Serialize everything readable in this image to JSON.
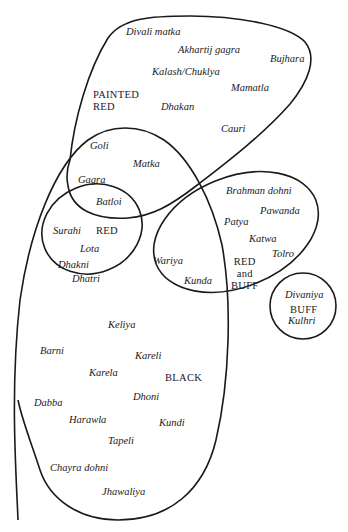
{
  "diagram": {
    "type": "venn-classification",
    "regions": [
      {
        "id": "painted_red",
        "label_lines": [
          "PAINTED",
          "RED"
        ],
        "items": [
          "Divali matka",
          "Akhartij gagra",
          "Bujhara",
          "Kalash/Chuklya",
          "Mamatla",
          "Dhakan",
          "Cauri"
        ]
      },
      {
        "id": "red",
        "label_lines": [
          "RED"
        ],
        "items": [
          "Surahi",
          "Lota",
          "Dhakni",
          "Dhatri"
        ]
      },
      {
        "id": "red_and_buff",
        "label_lines": [
          "RED",
          "and",
          "BUFF"
        ],
        "items": [
          "Brahman dohni",
          "Pawanda",
          "Patya",
          "Katwa",
          "Tolro",
          "Wariya",
          "Kunda"
        ]
      },
      {
        "id": "buff",
        "label_lines": [
          "BUFF"
        ],
        "items": [
          "Divaniya",
          "Kulhri"
        ]
      },
      {
        "id": "black",
        "label_lines": [
          "BLACK"
        ],
        "items": [
          "Keliya",
          "Barni",
          "Kareli",
          "Karela",
          "Dhoni",
          "Dabba",
          "Harawla",
          "Kundi",
          "Tapeli",
          "Chayra dohni",
          "Jhawaliya"
        ]
      }
    ],
    "overlap_items": {
      "painted_red_and_black": [
        "Goli",
        "Matka",
        "Gagra"
      ],
      "painted_red_red_black": [
        "Batloi"
      ]
    }
  },
  "labels": {
    "painted_red_1": "PAINTED",
    "painted_red_2": "RED",
    "red": "RED",
    "red_buff_1": "RED",
    "red_buff_2": "and",
    "red_buff_3": "BUFF",
    "buff": "BUFF",
    "black": "BLACK"
  },
  "items": {
    "divali_matka": "Divali matka",
    "akhartij_gagra": "Akhartij gagra",
    "bujhara": "Bujhara",
    "kalash_chuklya": "Kalash/Chuklya",
    "mamatla": "Mamatla",
    "dhakan": "Dhakan",
    "cauri": "Cauri",
    "goli": "Goli",
    "matka": "Matka",
    "gagra": "Gagra",
    "batloi": "Batloi",
    "surahi": "Surahi",
    "lota": "Lota",
    "dhakni": "Dhakni",
    "dhatri": "Dhatri",
    "brahman_dohni": "Brahman dohni",
    "pawanda": "Pawanda",
    "patya": "Patya",
    "katwa": "Katwa",
    "tolro": "Tolro",
    "wariya": "Wariya",
    "kunda": "Kunda",
    "divaniya": "Divaniya",
    "kulhri": "Kulhri",
    "keliya": "Keliya",
    "barni": "Barni",
    "kareli": "Kareli",
    "karela": "Karela",
    "dhoni": "Dhoni",
    "dabba": "Dabba",
    "harawla": "Harawla",
    "kundi": "Kundi",
    "tapeli": "Tapeli",
    "chayra_dohni": "Chayra dohni",
    "jhawaliya": "Jhawaliya"
  },
  "colors": {
    "stroke": "#1a1a1a",
    "background": "#ffffff"
  }
}
